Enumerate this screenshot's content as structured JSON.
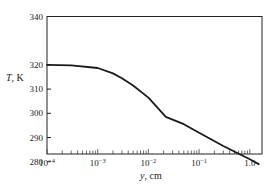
{
  "chart_data": {
    "type": "line",
    "title": "",
    "xlabel": "y, cm",
    "ylabel": "T, K",
    "xscale": "log",
    "xlim": [
      0.0001,
      2.0
    ],
    "ylim": [
      272,
      340
    ],
    "grid": false,
    "legend": null,
    "x_ticks": [
      {
        "value": 0.0001,
        "base": "10",
        "exp": "−4"
      },
      {
        "value": 0.001,
        "base": "10",
        "exp": "−3"
      },
      {
        "value": 0.01,
        "base": "10",
        "exp": "−2"
      },
      {
        "value": 0.1,
        "base": "10",
        "exp": "−1"
      },
      {
        "value": 1.0,
        "base": "1.0",
        "exp": ""
      }
    ],
    "y_ticks": [
      280,
      290,
      300,
      310,
      320,
      340
    ],
    "series": [
      {
        "name": "Temperature profile",
        "color": "#1a1a1a",
        "x": [
          0.0001,
          0.0003,
          0.001,
          0.002,
          0.003,
          0.005,
          0.01,
          0.022,
          0.05,
          0.1,
          0.3,
          1.0,
          1.5
        ],
        "y": [
          320,
          319.8,
          318.7,
          316.5,
          314.5,
          311.5,
          306.5,
          298.5,
          295.5,
          292,
          286.5,
          281,
          279
        ]
      }
    ]
  },
  "labels": {
    "xlabel_var": "y",
    "xlabel_unit": ", cm",
    "ylabel_var": "T",
    "ylabel_unit": ", K"
  }
}
